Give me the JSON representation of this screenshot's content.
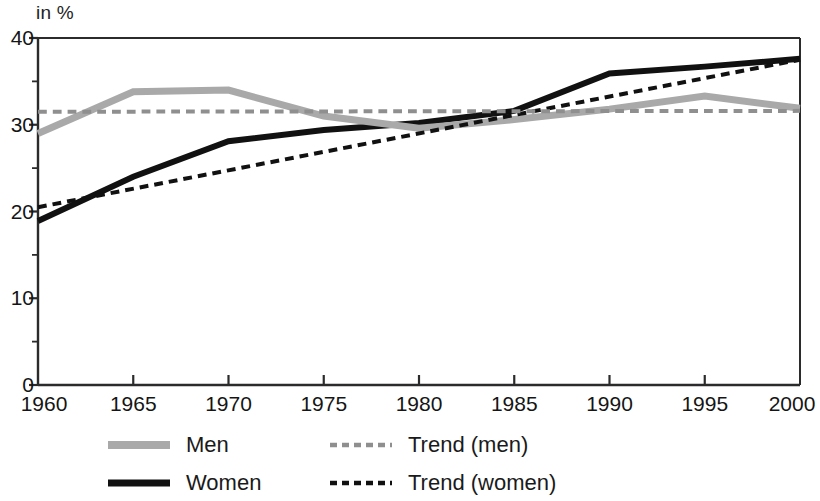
{
  "chart_data": {
    "type": "line",
    "title": "",
    "subtitle": "",
    "xlabel": "",
    "ylabel": "in %",
    "axis_unit_label": "in %",
    "x": [
      1960,
      1965,
      1970,
      1975,
      1980,
      1985,
      1990,
      1995,
      2000
    ],
    "xlim": [
      1960,
      2000
    ],
    "ylim": [
      0,
      40
    ],
    "xticks": [
      1960,
      1965,
      1970,
      1975,
      1980,
      1985,
      1990,
      1995,
      2000
    ],
    "xtick_labels": [
      "1960",
      "1965",
      "1970",
      "1975",
      "1980",
      "1985",
      "1990",
      "1995",
      "2000"
    ],
    "yticks": [
      0,
      10,
      20,
      30,
      40
    ],
    "ytick_labels": [
      "0",
      "10",
      "20",
      "30",
      "40"
    ],
    "yticks_minor": [
      5,
      15,
      25,
      35
    ],
    "grid": false,
    "legend_position": "bottom",
    "series": [
      {
        "name": "Men",
        "style": "solid",
        "color": "#a9a9a9",
        "width": 7,
        "x": [
          1960,
          1965,
          1970,
          1975,
          1980,
          1985,
          1990,
          1995,
          2000
        ],
        "values": [
          29.0,
          33.8,
          34.0,
          31.0,
          29.6,
          30.6,
          31.8,
          33.3,
          31.9
        ]
      },
      {
        "name": "Women",
        "style": "solid",
        "color": "#111111",
        "width": 6,
        "x": [
          1960,
          1965,
          1970,
          1975,
          1980,
          1985,
          1990,
          1995,
          2000
        ],
        "values": [
          18.9,
          24.0,
          28.1,
          29.4,
          30.2,
          31.6,
          35.9,
          36.7,
          37.6
        ]
      },
      {
        "name": "Trend (men)",
        "style": "dashed",
        "color": "#8f8f8f",
        "width": 4,
        "x": [
          1960,
          2000
        ],
        "values": [
          31.5,
          31.6
        ]
      },
      {
        "name": "Trend (women)",
        "style": "dashed",
        "color": "#111111",
        "width": 4,
        "x": [
          1960,
          2000
        ],
        "values": [
          20.5,
          37.5
        ]
      }
    ]
  },
  "legend": {
    "items": [
      {
        "label": "Men",
        "swatch": "men-line-swatch",
        "color": "#a9a9a9",
        "style": "solid"
      },
      {
        "label": "Women",
        "swatch": "women-line-swatch",
        "color": "#111111",
        "style": "solid"
      },
      {
        "label": "Trend (men)",
        "swatch": "trend-men-line-swatch",
        "color": "#8f8f8f",
        "style": "dashed"
      },
      {
        "label": "Trend (women)",
        "swatch": "trend-women-line-swatch",
        "color": "#111111",
        "style": "dashed"
      }
    ]
  },
  "colors": {
    "axis": "#2b2b2b",
    "men": "#a9a9a9",
    "women": "#111111",
    "trend_men": "#8f8f8f",
    "trend_women": "#111111",
    "background": "#ffffff"
  }
}
